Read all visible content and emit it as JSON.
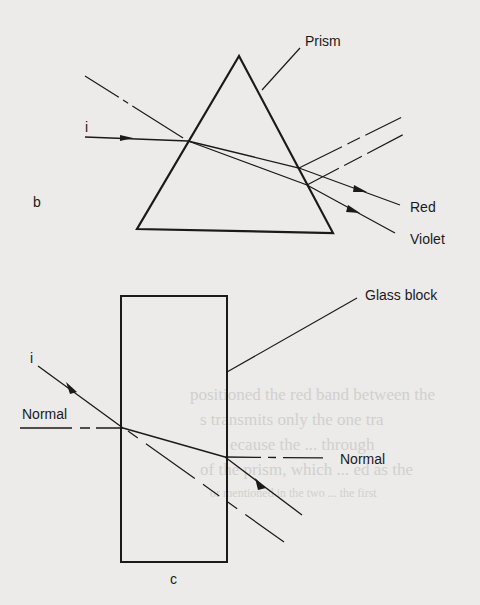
{
  "figure": {
    "panel_b": {
      "panel_label": "b",
      "prism_label": "Prism",
      "incident_label": "i",
      "ray_labels": {
        "red": "Red",
        "violet": "Violet"
      }
    },
    "panel_c": {
      "panel_label": "c",
      "block_label": "Glass block",
      "incident_label": "i",
      "normal_left_label": "Normal",
      "normal_right_label": "Normal"
    }
  },
  "background_text": [
    "positioned the red band between the",
    "s transmits only the one tra",
    "ecause the ... through",
    "of the prism, which ... ed as the",
    "or mentioned in the two ... the first"
  ],
  "colors": {
    "ink": "#1a1a1a",
    "paper": "#ecebea",
    "ghost_text": "#c9c7c4"
  }
}
